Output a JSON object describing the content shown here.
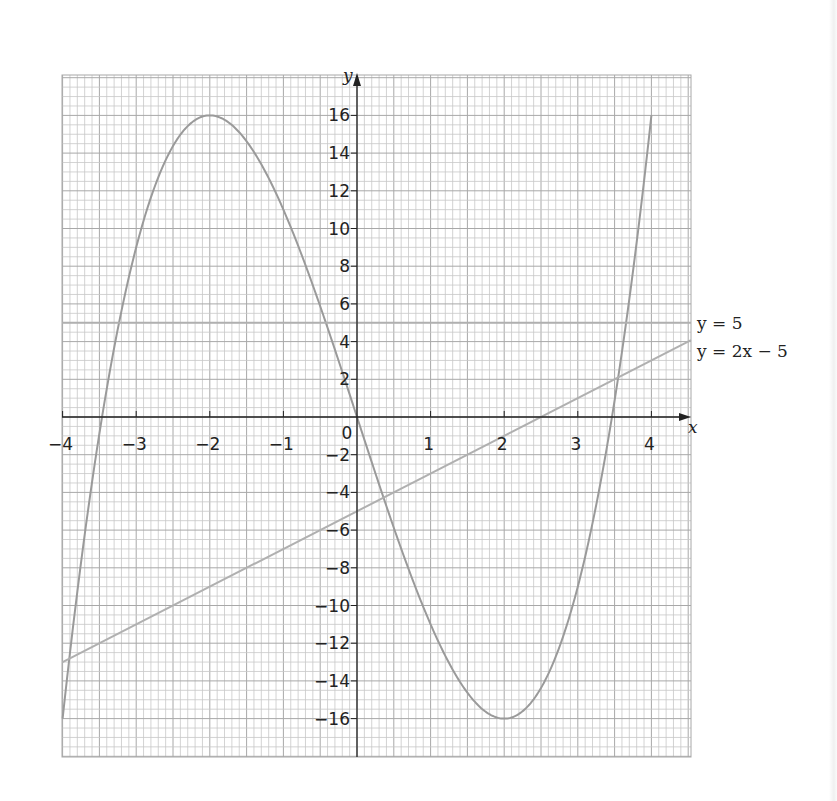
{
  "chart_data": {
    "type": "line",
    "title": "",
    "xlabel": "x",
    "ylabel": "y",
    "xlim": [
      -4,
      4.5
    ],
    "ylim": [
      -18,
      18
    ],
    "grid": true,
    "x_ticks": [
      -4,
      -3,
      -2,
      -1,
      0,
      1,
      2,
      3,
      4
    ],
    "x_tick_labels": [
      "−4",
      "−3",
      "−2",
      "−1",
      "0",
      "1",
      "2",
      "3",
      "4"
    ],
    "y_ticks": [
      -16,
      -14,
      -12,
      -10,
      -8,
      -6,
      -4,
      -2,
      2,
      4,
      6,
      8,
      10,
      12,
      14,
      16
    ],
    "y_tick_labels": [
      "−16",
      "−14",
      "−12",
      "−10",
      "−8",
      "−6",
      "−4",
      "−2",
      "2",
      "4",
      "6",
      "8",
      "10",
      "12",
      "14",
      "16"
    ],
    "series": [
      {
        "name": "y = x³ − 12x",
        "x": [
          -4,
          -3.5,
          -3,
          -2.5,
          -2,
          -1.5,
          -1,
          -0.5,
          0,
          0.5,
          1,
          1.5,
          2,
          2.5,
          3,
          3.5,
          4
        ],
        "values": [
          -16,
          -0.875,
          9,
          14.375,
          16,
          14.625,
          11,
          5.875,
          0,
          -5.875,
          -11,
          -14.625,
          -16,
          -14.375,
          -9,
          0.875,
          16
        ]
      },
      {
        "name": "y = 5",
        "label": "y = 5",
        "x": [
          -4,
          4.5
        ],
        "values": [
          5,
          5
        ]
      },
      {
        "name": "y = 2x − 5",
        "label": "y = 2x − 5",
        "x": [
          -4,
          4.5
        ],
        "values": [
          -13,
          4
        ]
      }
    ],
    "annotations": [
      "y = 5",
      "y = 2x − 5"
    ]
  },
  "labels": {
    "x_axis": "x",
    "y_axis": "y",
    "line1": "y = 5",
    "line2": "y = 2x − 5"
  },
  "colors": {
    "grid_minor": "#c8c8c8",
    "grid_major": "#a8a8a8",
    "axis": "#222222",
    "curve": "#9a9a9a",
    "line": "#b0b0b0"
  }
}
